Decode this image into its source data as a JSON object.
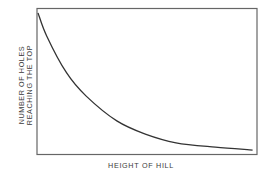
{
  "chart_data": {
    "type": "line",
    "title": "",
    "xlabel": "HEIGHT OF HILL",
    "ylabel_lines": [
      "NUMBER OF HOLES",
      "REACHING THE TOP"
    ],
    "ylabel": "NUMBER OF HOLES REACHING THE TOP",
    "grid": false,
    "legend": null,
    "ticks": false,
    "xlim": [
      0,
      1
    ],
    "ylim": [
      0,
      1
    ],
    "series": [
      {
        "name": "holes reaching top",
        "description": "monotonically decreasing, exponential-like decay curve",
        "x": [
          0.0,
          0.04,
          0.13,
          0.22,
          0.36,
          0.49,
          0.63,
          0.81,
          0.98
        ],
        "y": [
          0.97,
          0.81,
          0.56,
          0.4,
          0.23,
          0.14,
          0.08,
          0.05,
          0.03
        ]
      }
    ],
    "colors": {
      "line": "#333333",
      "frame": "#555555",
      "background": "#ffffff"
    }
  }
}
